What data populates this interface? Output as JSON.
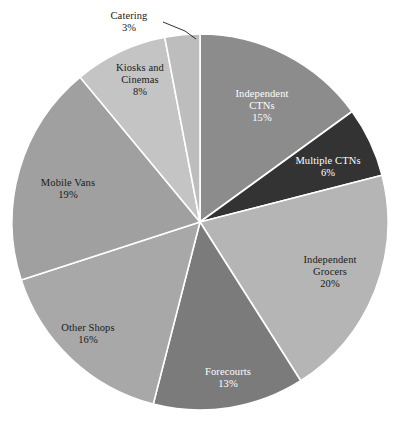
{
  "chart_data": {
    "type": "pie",
    "title": "",
    "subtitle": "",
    "xlabel": "",
    "ylabel": "",
    "legend": "none",
    "grid": false,
    "value_unit": "%",
    "total": 100,
    "start_angle_deg": 0,
    "direction": "clockwise",
    "categories": [
      "Independent CTNs",
      "Multiple CTNs",
      "Independent Grocers",
      "Forecourts",
      "Other Shops",
      "Mobile Vans",
      "Kiosks and Cinemas",
      "Catering"
    ],
    "values": [
      15,
      6,
      20,
      13,
      16,
      19,
      8,
      3
    ],
    "slices": [
      {
        "name": "Independent CTNs",
        "label_line1": "Independent",
        "label_line2": "CTNs",
        "value": 15,
        "value_label": "15%",
        "color": "#8c8c8c",
        "text_color": "#ffffff",
        "label_x": 262,
        "label_y": 88,
        "leader": false
      },
      {
        "name": "Multiple CTNs",
        "label_line1": "Multiple CTNs",
        "label_line2": "",
        "value": 6,
        "value_label": "6%",
        "color": "#333333",
        "text_color": "#ffffff",
        "label_x": 328,
        "label_y": 155,
        "leader": false
      },
      {
        "name": "Independent Grocers",
        "label_line1": "Independent",
        "label_line2": "Grocers",
        "value": 20,
        "value_label": "20%",
        "color": "#b5b5b5",
        "text_color": "#1a1a1a",
        "label_x": 330,
        "label_y": 254,
        "leader": false
      },
      {
        "name": "Forecourts",
        "label_line1": "Forecourts",
        "label_line2": "",
        "value": 13,
        "value_label": "13%",
        "color": "#7b7b7b",
        "text_color": "#ffffff",
        "label_x": 228,
        "label_y": 366,
        "leader": false
      },
      {
        "name": "Other Shops",
        "label_line1": "Other Shops",
        "label_line2": "",
        "value": 16,
        "value_label": "16%",
        "color": "#a8a8a8",
        "text_color": "#1a1a1a",
        "label_x": 88,
        "label_y": 322,
        "leader": false
      },
      {
        "name": "Mobile Vans",
        "label_line1": "Mobile Vans",
        "label_line2": "",
        "value": 19,
        "value_label": "19%",
        "color": "#a0a0a0",
        "text_color": "#1a1a1a",
        "label_x": 68,
        "label_y": 177,
        "leader": false
      },
      {
        "name": "Kiosks and Cinemas",
        "label_line1": "Kiosks and",
        "label_line2": "Cinemas",
        "value": 8,
        "value_label": "8%",
        "color": "#c4c4c4",
        "text_color": "#1a1a1a",
        "label_x": 140,
        "label_y": 62,
        "leader": false
      },
      {
        "name": "Catering",
        "label_line1": "Catering",
        "label_line2": "",
        "value": 3,
        "value_label": "3%",
        "color": "#bdbdbd",
        "text_color": "#1a1a1a",
        "label_x": 129,
        "label_y": 10,
        "leader": true,
        "leader_path": "M 163 22 L 185 31 L 196 39"
      }
    ],
    "geometry": {
      "center_x": 200,
      "center_y": 222,
      "radius": 188,
      "separator_color": "#ffffff",
      "separator_width": 1.6
    },
    "background_color": "#ffffff"
  }
}
